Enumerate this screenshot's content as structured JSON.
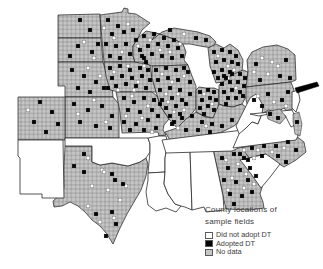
{
  "figure": {
    "legend": {
      "title_line1": "County locations of",
      "title_line2": "sample fields",
      "items": [
        {
          "label": "Did not adopt DT",
          "swatch": "hatched-white"
        },
        {
          "label": "Adopted DT",
          "swatch": "black"
        },
        {
          "label": "No data",
          "swatch": "gray"
        }
      ]
    }
  },
  "colors": {
    "background": "#ffffff",
    "no_data_fill": "#c6c6c6",
    "county_line": "#666666",
    "state_line": "#1c1c1c",
    "adopted_fill": "#000000",
    "not_adopted_fill": "#ffffff",
    "not_adopted_stroke": "#6e6e6e"
  },
  "map": {
    "adopted_counties": [
      [
        108,
        20
      ],
      [
        118,
        26
      ],
      [
        112,
        34
      ],
      [
        124,
        32
      ],
      [
        133,
        30
      ],
      [
        106,
        44
      ],
      [
        116,
        46
      ],
      [
        126,
        44
      ],
      [
        136,
        40
      ],
      [
        110,
        56
      ],
      [
        120,
        58
      ],
      [
        130,
        54
      ],
      [
        140,
        50
      ],
      [
        144,
        58
      ],
      [
        80,
        20
      ],
      [
        90,
        30
      ],
      [
        78,
        46
      ],
      [
        92,
        52
      ],
      [
        98,
        44
      ],
      [
        70,
        56
      ],
      [
        72,
        70
      ],
      [
        84,
        76
      ],
      [
        96,
        82
      ],
      [
        104,
        88
      ],
      [
        90,
        92
      ],
      [
        78,
        88
      ],
      [
        74,
        104
      ],
      [
        88,
        110
      ],
      [
        102,
        106
      ],
      [
        112,
        116
      ],
      [
        80,
        122
      ],
      [
        96,
        126
      ],
      [
        110,
        128
      ],
      [
        40,
        102
      ],
      [
        52,
        112
      ],
      [
        34,
        122
      ],
      [
        46,
        132
      ],
      [
        58,
        124
      ],
      [
        110,
        68
      ],
      [
        120,
        66
      ],
      [
        130,
        70
      ],
      [
        140,
        68
      ],
      [
        148,
        70
      ],
      [
        112,
        78
      ],
      [
        122,
        76
      ],
      [
        132,
        78
      ],
      [
        142,
        76
      ],
      [
        150,
        80
      ],
      [
        116,
        86
      ],
      [
        126,
        84
      ],
      [
        136,
        86
      ],
      [
        146,
        88
      ],
      [
        108,
        88
      ],
      [
        124,
        98
      ],
      [
        134,
        102
      ],
      [
        144,
        98
      ],
      [
        154,
        100
      ],
      [
        128,
        110
      ],
      [
        140,
        112
      ],
      [
        152,
        110
      ],
      [
        160,
        104
      ],
      [
        124,
        122
      ],
      [
        136,
        124
      ],
      [
        148,
        120
      ],
      [
        158,
        116
      ],
      [
        130,
        130
      ],
      [
        144,
        130
      ],
      [
        156,
        128
      ],
      [
        156,
        70
      ],
      [
        166,
        68
      ],
      [
        176,
        70
      ],
      [
        184,
        68
      ],
      [
        158,
        80
      ],
      [
        168,
        78
      ],
      [
        178,
        80
      ],
      [
        188,
        72
      ],
      [
        160,
        90
      ],
      [
        170,
        88
      ],
      [
        180,
        90
      ],
      [
        190,
        82
      ],
      [
        162,
        100
      ],
      [
        172,
        98
      ],
      [
        182,
        100
      ],
      [
        190,
        94
      ],
      [
        166,
        108
      ],
      [
        176,
        106
      ],
      [
        186,
        104
      ],
      [
        170,
        116
      ],
      [
        180,
        114
      ],
      [
        174,
        122
      ],
      [
        144,
        36
      ],
      [
        154,
        34
      ],
      [
        164,
        38
      ],
      [
        174,
        40
      ],
      [
        148,
        46
      ],
      [
        158,
        44
      ],
      [
        168,
        46
      ],
      [
        178,
        48
      ],
      [
        142,
        56
      ],
      [
        152,
        54
      ],
      [
        162,
        56
      ],
      [
        172,
        58
      ],
      [
        182,
        56
      ],
      [
        146,
        62
      ],
      [
        170,
        30
      ],
      [
        196,
        38
      ],
      [
        206,
        40
      ],
      [
        214,
        52
      ],
      [
        222,
        50
      ],
      [
        230,
        52
      ],
      [
        236,
        56
      ],
      [
        216,
        62
      ],
      [
        224,
        60
      ],
      [
        232,
        62
      ],
      [
        238,
        64
      ],
      [
        214,
        72
      ],
      [
        222,
        70
      ],
      [
        230,
        72
      ],
      [
        218,
        78
      ],
      [
        226,
        78
      ],
      [
        200,
        92
      ],
      [
        208,
        90
      ],
      [
        214,
        92
      ],
      [
        202,
        100
      ],
      [
        210,
        98
      ],
      [
        216,
        100
      ],
      [
        200,
        108
      ],
      [
        208,
        106
      ],
      [
        214,
        110
      ],
      [
        204,
        114
      ],
      [
        224,
        76
      ],
      [
        232,
        74
      ],
      [
        240,
        74
      ],
      [
        245,
        78
      ],
      [
        222,
        84
      ],
      [
        230,
        82
      ],
      [
        238,
        82
      ],
      [
        244,
        86
      ],
      [
        224,
        92
      ],
      [
        232,
        90
      ],
      [
        240,
        92
      ],
      [
        228,
        98
      ],
      [
        236,
        98
      ],
      [
        243,
        96
      ],
      [
        226,
        104
      ],
      [
        172,
        124
      ],
      [
        182,
        118
      ],
      [
        192,
        116
      ],
      [
        202,
        122
      ],
      [
        212,
        124
      ],
      [
        222,
        126
      ],
      [
        232,
        120
      ],
      [
        186,
        130
      ],
      [
        198,
        130
      ],
      [
        210,
        132
      ],
      [
        256,
        64
      ],
      [
        286,
        60
      ],
      [
        280,
        76
      ],
      [
        260,
        80
      ],
      [
        290,
        78
      ],
      [
        254,
        100
      ],
      [
        268,
        94
      ],
      [
        282,
        100
      ],
      [
        262,
        106
      ],
      [
        288,
        92
      ],
      [
        270,
        114
      ],
      [
        278,
        118
      ],
      [
        297,
        122
      ],
      [
        240,
        154
      ],
      [
        252,
        148
      ],
      [
        264,
        146
      ],
      [
        276,
        146
      ],
      [
        288,
        142
      ],
      [
        296,
        150
      ],
      [
        248,
        160
      ],
      [
        262,
        156
      ],
      [
        278,
        156
      ],
      [
        286,
        162
      ],
      [
        222,
        158
      ],
      [
        234,
        154
      ],
      [
        244,
        158
      ],
      [
        228,
        168
      ],
      [
        240,
        170
      ],
      [
        250,
        168
      ],
      [
        224,
        180
      ],
      [
        236,
        182
      ],
      [
        248,
        180
      ],
      [
        256,
        176
      ],
      [
        230,
        194
      ],
      [
        242,
        196
      ],
      [
        252,
        192
      ],
      [
        234,
        204
      ],
      [
        84,
        154
      ],
      [
        74,
        166
      ],
      [
        84,
        172
      ],
      [
        112,
        174
      ],
      [
        115,
        180
      ],
      [
        123,
        184
      ],
      [
        96,
        214
      ],
      [
        112,
        212
      ],
      [
        116,
        224
      ],
      [
        106,
        236
      ]
    ],
    "not_adopted_counties": [
      [
        104,
        28
      ],
      [
        114,
        38
      ],
      [
        128,
        24
      ],
      [
        122,
        52
      ],
      [
        138,
        46
      ],
      [
        84,
        42
      ],
      [
        94,
        58
      ],
      [
        88,
        68
      ],
      [
        100,
        76
      ],
      [
        94,
        100
      ],
      [
        106,
        122
      ],
      [
        78,
        114
      ],
      [
        28,
        110
      ],
      [
        114,
        72
      ],
      [
        128,
        66
      ],
      [
        138,
        82
      ],
      [
        118,
        90
      ],
      [
        144,
        66
      ],
      [
        134,
        90
      ],
      [
        132,
        96
      ],
      [
        148,
        106
      ],
      [
        126,
        116
      ],
      [
        142,
        118
      ],
      [
        152,
        132
      ],
      [
        162,
        74
      ],
      [
        172,
        82
      ],
      [
        184,
        76
      ],
      [
        166,
        94
      ],
      [
        178,
        94
      ],
      [
        168,
        102
      ],
      [
        184,
        110
      ],
      [
        174,
        112
      ],
      [
        150,
        40
      ],
      [
        160,
        50
      ],
      [
        170,
        52
      ],
      [
        180,
        44
      ],
      [
        184,
        34
      ],
      [
        218,
        56
      ],
      [
        228,
        66
      ],
      [
        234,
        70
      ],
      [
        204,
        94
      ],
      [
        212,
        104
      ],
      [
        228,
        78
      ],
      [
        236,
        88
      ],
      [
        178,
        128
      ],
      [
        206,
        126
      ],
      [
        262,
        58
      ],
      [
        272,
        62
      ],
      [
        268,
        74
      ],
      [
        278,
        66
      ],
      [
        254,
        72
      ],
      [
        258,
        96
      ],
      [
        274,
        102
      ],
      [
        286,
        106
      ],
      [
        244,
        150
      ],
      [
        258,
        150
      ],
      [
        272,
        152
      ],
      [
        284,
        148
      ],
      [
        254,
        158
      ],
      [
        226,
        160
      ],
      [
        238,
        164
      ],
      [
        246,
        174
      ],
      [
        232,
        178
      ],
      [
        244,
        188
      ],
      [
        228,
        190
      ],
      [
        254,
        184
      ],
      [
        88,
        158
      ],
      [
        102,
        170
      ],
      [
        92,
        186
      ],
      [
        108,
        190
      ],
      [
        120,
        200
      ],
      [
        100,
        222
      ],
      [
        114,
        218
      ],
      [
        126,
        186
      ],
      [
        88,
        206
      ],
      [
        104,
        172
      ]
    ]
  }
}
